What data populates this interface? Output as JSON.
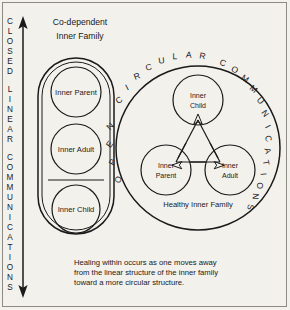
{
  "figure": {
    "background_color": "#f3f1ec",
    "ink_color": "#1a1a1a",
    "left_axis": {
      "name": "closed-linear-communications-axis",
      "text": "CLOSED LINEAR COMMUNICATIONS",
      "letters": [
        "C",
        "L",
        "O",
        "S",
        "E",
        "D",
        "L",
        "I",
        "N",
        "E",
        "A",
        "R",
        "C",
        "O",
        "M",
        "M",
        "U",
        "N",
        "I",
        "C",
        "A",
        "T",
        "I",
        "O",
        "N",
        "S"
      ],
      "arrow": "double-headed-vertical"
    },
    "left_panel": {
      "name": "co-dependent-inner-family",
      "heading_line1": "Co-dependent",
      "heading_line2": "Inner Family",
      "shape": "stadium",
      "items": [
        {
          "label": "Inner Parent"
        },
        {
          "label": "Inner Adult"
        },
        {
          "label": "Inner Child"
        }
      ],
      "divider": true
    },
    "right_panel": {
      "name": "healthy-inner-family",
      "arc_text": "OPEN CIRCULAR COMMUNICATIONS",
      "arc_letters": [
        "O",
        "P",
        "E",
        "N",
        "C",
        "I",
        "R",
        "C",
        "U",
        "L",
        "A",
        "R",
        "C",
        "O",
        "M",
        "M",
        "U",
        "N",
        "I",
        "C",
        "A",
        "T",
        "I",
        "O",
        "N",
        "S"
      ],
      "caption_label": "Healthy Inner Family",
      "nodes": [
        {
          "label_line1": "Inner",
          "label_line2": "Child"
        },
        {
          "label_line1": "Inner",
          "label_line2": "Parent"
        },
        {
          "label_line1": "Inner",
          "label_line2": "Adult"
        }
      ],
      "connector": "triangle-with-arrowheads"
    },
    "caption": {
      "line1": "Healing within occurs as one moves away",
      "line2": "from the linear structure of the inner family",
      "line3": "toward a more circular structure."
    }
  }
}
